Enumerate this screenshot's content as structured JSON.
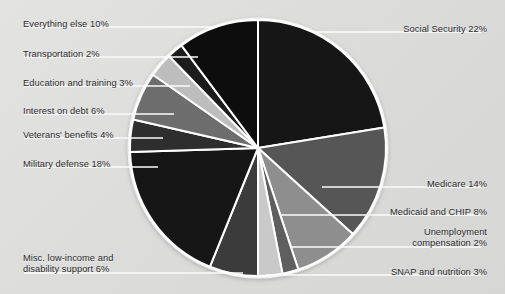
{
  "chart_data": {
    "type": "pie",
    "title": "",
    "subtitle": "",
    "xlabel": "",
    "ylabel": "",
    "legend_position": "callout-labels",
    "grid": false,
    "units": "percent",
    "total": 100,
    "background_color": "#dcdcdb",
    "slice_border_color": "#ffffff",
    "center": {
      "x": 258,
      "y": 148
    },
    "radius": 128,
    "start_angle_deg": 0,
    "direction": "clockwise",
    "categories": [
      "Social Security",
      "Medicare",
      "Medicaid and CHIP",
      "Unemployment compensation",
      "SNAP and nutrition",
      "Misc. low-income and disability support",
      "Military defense",
      "Veterans' benefits",
      "Interest on debt",
      "Education and training",
      "Transportation",
      "Everything else"
    ],
    "values": [
      22,
      14,
      8,
      2,
      3,
      6,
      18,
      4,
      6,
      3,
      2,
      10
    ],
    "colors": [
      "#141414",
      "#575757",
      "#8e8e8e",
      "#5e5e5e",
      "#c9c9c9",
      "#3a3a3a",
      "#181818",
      "#2f2f2f",
      "#6d6d6d",
      "#bdbdbd",
      "#1d1d1d",
      "#101010"
    ],
    "slices": [
      {
        "label": "Social Security 22%",
        "name": "Social Security",
        "value": 22,
        "color": "#141414"
      },
      {
        "label": "Medicare 14%",
        "name": "Medicare",
        "value": 14,
        "color": "#575757"
      },
      {
        "label": "Medicaid and CHIP 8%",
        "name": "Medicaid and CHIP",
        "value": 8,
        "color": "#8e8e8e"
      },
      {
        "label": "Unemployment\ncompensation 2%",
        "name": "Unemployment compensation",
        "value": 2,
        "color": "#5e5e5e"
      },
      {
        "label": "SNAP and nutrition 3%",
        "name": "SNAP and nutrition",
        "value": 3,
        "color": "#c9c9c9"
      },
      {
        "label": "Misc. low-income and\ndisability support 6%",
        "name": "Misc. low-income and disability support",
        "value": 6,
        "color": "#3a3a3a"
      },
      {
        "label": "Military defense 18%",
        "name": "Military defense",
        "value": 18,
        "color": "#181818"
      },
      {
        "label": "Veterans' benefits 4%",
        "name": "Veterans' benefits",
        "value": 4,
        "color": "#2f2f2f"
      },
      {
        "label": "Interest on debt 6%",
        "name": "Interest on debt",
        "value": 6,
        "color": "#6d6d6d"
      },
      {
        "label": "Education and training 3%",
        "name": "Education and training",
        "value": 3,
        "color": "#bdbdbd"
      },
      {
        "label": "Transportation 2%",
        "name": "Transportation",
        "value": 2,
        "color": "#1d1d1d"
      },
      {
        "label": "Everything else 10%",
        "name": "Everything else",
        "value": 10,
        "color": "#101010"
      }
    ]
  },
  "labels": {
    "everything_else": "Everything else 10%",
    "transportation": "Transportation 2%",
    "education_and_training": "Education and training 3%",
    "interest_on_debt": "Interest on debt 6%",
    "veterans_benefits": "Veterans' benefits 4%",
    "military_defense": "Military defense 18%",
    "misc_low_income": "Misc. low-income and\ndisability support 6%",
    "social_security": "Social Security 22%",
    "medicare": "Medicare 14%",
    "medicaid_and_chip": "Medicaid and CHIP 8%",
    "unemployment_compensation": "Unemployment\ncompensation 2%",
    "snap_and_nutrition": "SNAP and nutrition 3%"
  }
}
